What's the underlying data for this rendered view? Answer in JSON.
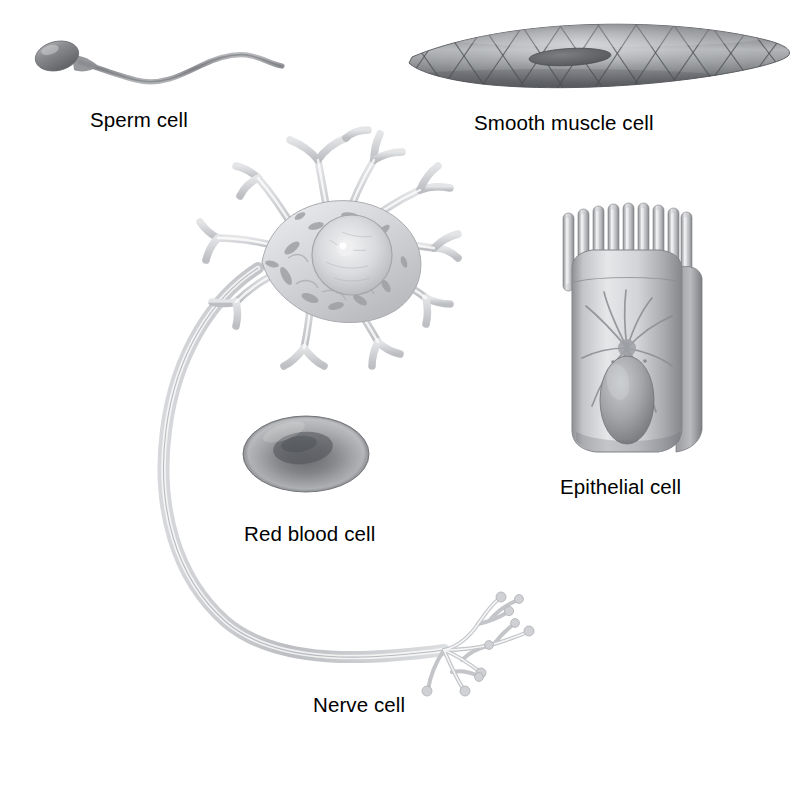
{
  "figure": {
    "background_color": "#ffffff",
    "label_color": "#000000",
    "style": "grayscale pencil / airbrush medical illustration"
  },
  "cells": [
    {
      "id": "sperm",
      "label": "Sperm cell",
      "icon": "sperm-cell-illustration",
      "description": "Oval head with midpiece and long wavy flagellar tail",
      "tone": "#8d8f92",
      "position": {
        "x": 40,
        "y": 38,
        "width": 245,
        "height": 48
      },
      "label_position": {
        "x": 90,
        "y": 110
      }
    },
    {
      "id": "smooth-muscle",
      "label": "Smooth muscle cell",
      "icon": "smooth-muscle-cell-illustration",
      "description": "Elongated spindle-shaped cell with diamond crosshatch fiber lattice and central rod-shaped nucleus",
      "tone": "#8a8c8f",
      "position": {
        "x": 408,
        "y": 22,
        "width": 382,
        "height": 72
      },
      "label_position": {
        "x": 474,
        "y": 113
      }
    },
    {
      "id": "nerve",
      "label": "Nerve cell",
      "icon": "nerve-cell-illustration",
      "description": "Neuron with branching dendrites, nucleus and nucleolus, long curving axon and branched axon terminals with synaptic knobs",
      "tone": "#b9bbbe",
      "position": {
        "x": 150,
        "y": 128,
        "width": 360,
        "height": 565
      },
      "label_position": {
        "x": 313,
        "y": 695
      }
    },
    {
      "id": "red-blood",
      "label": "Red blood cell",
      "icon": "red-blood-cell-illustration",
      "description": "Biconcave disc with darker depressed center",
      "tone": "#7e8084",
      "position": {
        "x": 243,
        "y": 416,
        "width": 126,
        "height": 76
      },
      "label_position": {
        "x": 244,
        "y": 524
      }
    },
    {
      "id": "epithelial",
      "label": "Epithelial cell",
      "icon": "epithelial-cell-illustration",
      "description": "Columnar cell topped with microvilli, containing an oval nucleus and radiating cytoskeletal filaments",
      "tone": "#a8aaad",
      "position": {
        "x": 558,
        "y": 203,
        "width": 148,
        "height": 250
      },
      "label_position": {
        "x": 560,
        "y": 477
      }
    }
  ]
}
